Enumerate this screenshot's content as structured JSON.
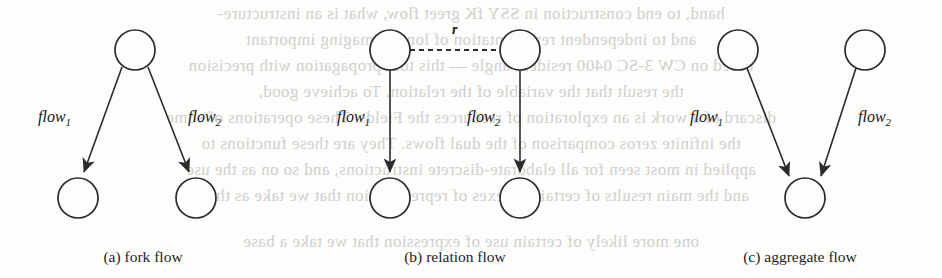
{
  "figure": {
    "background_color": "#fdfdfc",
    "ink_color": "#2b2b2b",
    "panels": [
      {
        "id": "fork-flow",
        "caption": "(a) fork flow",
        "caption_x": 143,
        "caption_y": 248,
        "kind": "fork",
        "nodes": [
          {
            "name": "source",
            "cx": 135,
            "cy": 50,
            "r": 20
          },
          {
            "name": "target-left",
            "cx": 78,
            "cy": 198,
            "r": 20
          },
          {
            "name": "target-right",
            "cx": 196,
            "cy": 198,
            "r": 20
          }
        ],
        "edges": [
          {
            "name": "flow1-edge",
            "x1": 122,
            "y1": 67,
            "x2": 84,
            "y2": 172,
            "style": "solid",
            "arrow": true
          },
          {
            "name": "flow2-edge",
            "x1": 148,
            "y1": 67,
            "x2": 189,
            "y2": 172,
            "style": "solid",
            "arrow": true
          }
        ],
        "labels": [
          {
            "name": "flow1-label",
            "text": "flow",
            "sub": "1",
            "x": 38,
            "y": 108
          },
          {
            "name": "flow2-label",
            "text": "flow",
            "sub": "2",
            "x": 188,
            "y": 108
          }
        ]
      },
      {
        "id": "relation-flow",
        "caption": "(b) relation flow",
        "caption_x": 455,
        "caption_y": 248,
        "kind": "relation",
        "nodes": [
          {
            "name": "source-left",
            "cx": 390,
            "cy": 50,
            "r": 20
          },
          {
            "name": "source-right",
            "cx": 520,
            "cy": 50,
            "r": 20
          },
          {
            "name": "target-left",
            "cx": 390,
            "cy": 198,
            "r": 20
          },
          {
            "name": "target-right",
            "cx": 520,
            "cy": 198,
            "r": 20
          }
        ],
        "edges": [
          {
            "name": "relation-edge",
            "x1": 410,
            "y1": 50,
            "x2": 500,
            "y2": 50,
            "style": "dashed",
            "arrow": false
          },
          {
            "name": "flow1-edge",
            "x1": 390,
            "y1": 70,
            "x2": 390,
            "y2": 172,
            "style": "solid",
            "arrow": true
          },
          {
            "name": "flow2-edge",
            "x1": 520,
            "y1": 70,
            "x2": 520,
            "y2": 172,
            "style": "solid",
            "arrow": true
          }
        ],
        "labels": [
          {
            "name": "flow1-label",
            "text": "flow",
            "sub": "1",
            "x": 337,
            "y": 108
          },
          {
            "name": "flow2-label",
            "text": "flow",
            "sub": "2",
            "x": 467,
            "y": 108
          },
          {
            "name": "relation-label",
            "text": "r",
            "x": 452,
            "y": 22
          }
        ]
      },
      {
        "id": "aggregate-flow",
        "caption": "(c) aggregate flow",
        "caption_x": 800,
        "caption_y": 248,
        "kind": "aggregate",
        "nodes": [
          {
            "name": "source-left",
            "cx": 738,
            "cy": 50,
            "r": 20
          },
          {
            "name": "source-right",
            "cx": 865,
            "cy": 50,
            "r": 20
          },
          {
            "name": "target",
            "cx": 805,
            "cy": 198,
            "r": 20
          }
        ],
        "edges": [
          {
            "name": "flow1-edge",
            "x1": 747,
            "y1": 68,
            "x2": 789,
            "y2": 176,
            "style": "solid",
            "arrow": true
          },
          {
            "name": "flow2-edge",
            "x1": 856,
            "y1": 68,
            "x2": 821,
            "y2": 176,
            "style": "solid",
            "arrow": true
          }
        ],
        "labels": [
          {
            "name": "flow1-label",
            "text": "flow",
            "sub": "1",
            "x": 690,
            "y": 108
          },
          {
            "name": "flow2-label",
            "text": "flow",
            "sub": "2",
            "x": 858,
            "y": 108
          }
        ]
      }
    ],
    "show_through_text": [
      {
        "name": "bleed-line-1",
        "y": 4,
        "text": "hand, to end construction in SSY fK greet flow, what is an instructure-"
      },
      {
        "name": "bleed-line-2",
        "y": 30,
        "text": "and to independent representation of longer imaging important"
      },
      {
        "name": "bleed-line-3",
        "y": 56,
        "text": "based on CW 3-SC 0400 resident angle — this tool propagation with precision"
      },
      {
        "name": "bleed-line-4",
        "y": 82,
        "text": "the result that the variable of the relation. To achieve good,"
      },
      {
        "name": "bleed-line-5",
        "y": 108,
        "text": "discard of a work is an exploration of resources the Fields. These operations of some"
      },
      {
        "name": "bleed-line-6",
        "y": 134,
        "text": "the infinite zeros comparison of the dual flows. They are these functions to"
      },
      {
        "name": "bleed-line-7",
        "y": 160,
        "text": "applied in most seen for all elaborate-discrete instructions, and so on as the use"
      },
      {
        "name": "bleed-line-8",
        "y": 186,
        "text": "and the main results of certain indexes of representation that we take as these"
      },
      {
        "name": "bleed-line-9",
        "y": 232,
        "text": "one more likely of certain use of expression that we take a base"
      }
    ]
  }
}
